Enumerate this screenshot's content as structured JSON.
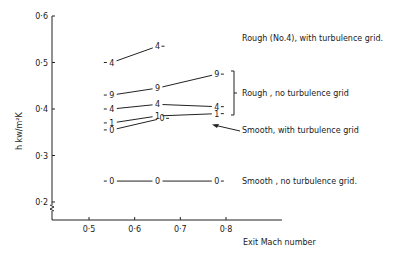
{
  "chart_data": {
    "type": "line",
    "title": "",
    "xlabel": "Exit Mach number",
    "ylabel": "h kw/m²K",
    "xlim": [
      0.42,
      0.92
    ],
    "ylim": [
      0.2,
      0.6
    ],
    "xticks": [
      "0·5",
      "0·6",
      "0·7",
      "0·8"
    ],
    "xtick_values": [
      0.5,
      0.6,
      0.7,
      0.8
    ],
    "yticks": [
      "0·2",
      "0·3",
      "0·4",
      "0·5",
      "0·6"
    ],
    "ytick_values": [
      0.2,
      0.3,
      0.4,
      0.5,
      0.6
    ],
    "grid": false,
    "axis_break": "y-axis below 0.2",
    "series": [
      {
        "name": "Rough (No.4), with turbulence grid",
        "marker": "4",
        "x": [
          0.55,
          0.65
        ],
        "y": [
          0.5,
          0.535
        ]
      },
      {
        "name": "Rough (No.9), no turbulence grid",
        "marker": "9",
        "x": [
          0.55,
          0.65,
          0.78
        ],
        "y": [
          0.43,
          0.445,
          0.475
        ]
      },
      {
        "name": "Rough (No.4), no turbulence grid",
        "marker": "4",
        "x": [
          0.55,
          0.65,
          0.78
        ],
        "y": [
          0.4,
          0.41,
          0.405
        ]
      },
      {
        "name": "Smooth (No.1), with turbulence grid",
        "marker": "1",
        "x": [
          0.55,
          0.65,
          0.78
        ],
        "y": [
          0.37,
          0.385,
          0.39
        ]
      },
      {
        "name": "Smooth (No.0), with turbulence grid",
        "marker": "0",
        "x": [
          0.55,
          0.66
        ],
        "y": [
          0.355,
          0.38
        ]
      },
      {
        "name": "Smooth, no turbulence grid",
        "marker": "0",
        "x": [
          0.55,
          0.65,
          0.78
        ],
        "y": [
          0.245,
          0.245,
          0.245
        ]
      }
    ],
    "annotations": [
      {
        "text": "Rough (No.4), with turbulence grid.",
        "target": "top curve"
      },
      {
        "text": "Rough , no turbulence grid",
        "target": "bracket over curves 9 and 4"
      },
      {
        "text": "Smooth, with turbulence grid",
        "target": "arrow to curves 1 and 0"
      },
      {
        "text": "Smooth , no turbulence grid.",
        "target": "bottom curve"
      }
    ]
  }
}
